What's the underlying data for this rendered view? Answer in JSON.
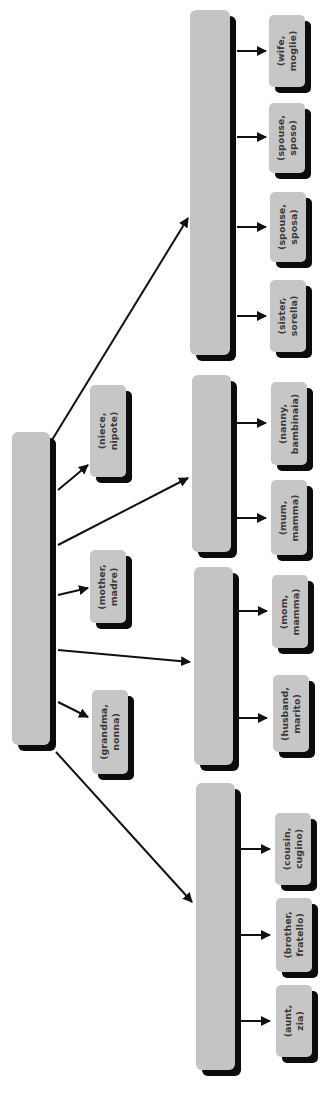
{
  "diagram": {
    "orientation": "rotated-90-ccw",
    "colors": {
      "box_fill": "#c4c4c4",
      "shadow": "#0c0c0c",
      "text": "#3a3a3a",
      "line": "#111111"
    },
    "root": {
      "label": ""
    },
    "direct_children": [
      {
        "id": "niece",
        "line1": "(niece,",
        "line2": "nipote)"
      },
      {
        "id": "mother",
        "line1": "(mother,",
        "line2": "madre)"
      },
      {
        "id": "grandma",
        "line1": "(grandma,",
        "line2": "nonna)"
      }
    ],
    "groups": [
      {
        "id": "group-1",
        "label": "",
        "children": [
          {
            "line1": "(wife,",
            "line2": "moglie)"
          },
          {
            "line1": "(spouse,",
            "line2": "sposo)"
          },
          {
            "line1": "(spouse,",
            "line2": "sposa)"
          },
          {
            "line1": "(sister,",
            "line2": "sorella)"
          }
        ]
      },
      {
        "id": "group-2",
        "label": "",
        "children": [
          {
            "line1": "(nanny,",
            "line2": "bambinaia)"
          },
          {
            "line1": "(mum,",
            "line2": "mamma)"
          }
        ]
      },
      {
        "id": "group-3",
        "label": "",
        "children": [
          {
            "line1": "(mom,",
            "line2": "mamma)"
          },
          {
            "line1": "(husband,",
            "line2": "marito)"
          }
        ]
      },
      {
        "id": "group-4",
        "label": "",
        "children": [
          {
            "line1": "(cousin,",
            "line2": "cugino)"
          },
          {
            "line1": "(brother,",
            "line2": "fratello)"
          },
          {
            "line1": "(aunt,",
            "line2": "zia)"
          }
        ]
      }
    ]
  }
}
